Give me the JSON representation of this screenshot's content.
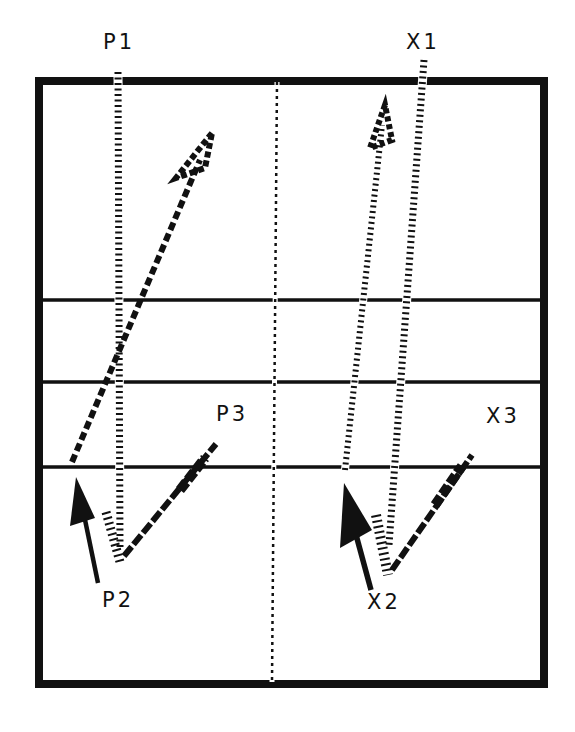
{
  "diagram": {
    "labels": {
      "p1": "P1",
      "p2": "P2",
      "p3": "P3",
      "x1": "X1",
      "x2": "X2",
      "x3": "X3"
    },
    "colors": {
      "line": "#111111",
      "background": "#ffffff"
    },
    "court": {
      "x": 39,
      "y": 82,
      "width": 505,
      "height": 602,
      "border_width": 8,
      "horizontal_lines_y": [
        300,
        382,
        467
      ],
      "center_line_x": 274
    },
    "paths": {
      "p_pattern": [
        {
          "from": [
            118,
            76
          ],
          "to": [
            120,
            555
          ],
          "style": "hatched"
        },
        {
          "from": [
            120,
            555
          ],
          "to": [
            215,
            445
          ],
          "style": "hatched"
        },
        {
          "from": [
            72,
            462
          ],
          "to": [
            210,
            135
          ],
          "style": "hatched-arrow"
        }
      ],
      "x_pattern": [
        {
          "from": [
            423,
            60
          ],
          "to": [
            387,
            572
          ],
          "style": "hatched"
        },
        {
          "from": [
            387,
            572
          ],
          "to": [
            470,
            455
          ],
          "style": "hatched"
        },
        {
          "from": [
            345,
            470
          ],
          "to": [
            385,
            110
          ],
          "style": "hatched-arrow"
        }
      ]
    },
    "arrows": [
      {
        "name": "p2-arrow",
        "from": [
          97,
          583
        ],
        "to": [
          77,
          478
        ]
      },
      {
        "name": "x2-arrow",
        "from": [
          370,
          590
        ],
        "to": [
          345,
          483
        ]
      }
    ]
  }
}
